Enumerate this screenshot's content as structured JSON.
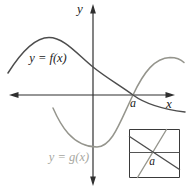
{
  "figure": {
    "axis_labels": {
      "vertical": "y",
      "horizontal": "x"
    },
    "curve_labels": {
      "f": "y = f(x)",
      "g": "y = g(x)"
    },
    "point_label": "a",
    "inset": {
      "point_label": "a"
    },
    "colors": {
      "axis": "#2f2f2f",
      "f_curve": "#4d4d4d",
      "g_curve": "#95958d",
      "label_dark": "#222222",
      "g_label": "#a7a7a0",
      "background": "#ffffff"
    },
    "geometry": {
      "x_axis_path": "M 12 95 L 172 95",
      "y_axis_path": "M 93 8 L 93 182",
      "f_curve_path": "M 8 73 C 20 54 34 37.5 49 37.5 C 64 37.5 77 54 93 67 C 106 77.5 120 85.5 133 95 C 146 104.5 165 109.5 185 112",
      "g_curve_path": "M 53 108 C 60 124 72 147 97 147 C 112 147 120 122 133 95 C 144 71.5 155 58 170 57.5 C 176 57.5 181 59.5 184 62.5",
      "inset_box_path": "M 129.5 129.5 L 179.5 129.5 L 179.5 177.5 L 129.5 177.5 Z",
      "inset_axis_path": "M 129.5 152.5 L 179.5 152.5",
      "inset_f_path": "M 129.5 136.5 L 179.5 169.5",
      "inset_g_path": "M 137.5 177.5 L 166.5 129.5"
    }
  }
}
